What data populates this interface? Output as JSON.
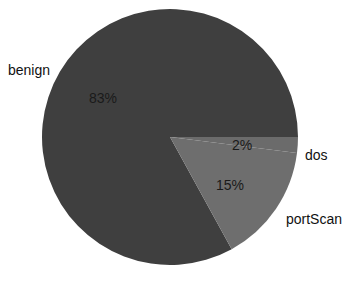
{
  "chart_data": {
    "type": "pie",
    "title": "",
    "categories": [
      "benign",
      "dos",
      "portScan"
    ],
    "values": [
      83,
      2,
      15
    ],
    "value_labels": [
      "83%",
      "2%",
      "15%"
    ],
    "units": "percent",
    "legend_position": "outside-labels",
    "grid": false,
    "colors": {
      "benign": "#3f3f3f",
      "dos": "#6b6b6b",
      "portScan": "#6e6e6e",
      "background": "#ffffff",
      "label_text": "#111111"
    },
    "geometry": {
      "center_x": 170,
      "center_y": 137,
      "radius": 128,
      "start_angle_deg": 0,
      "direction": "clockwise"
    },
    "slices": [
      {
        "name": "benign",
        "percent": 83,
        "label": "benign",
        "value_label": "83%",
        "color": "#3f3f3f",
        "start_angle_deg": 61.2,
        "end_angle_deg": 360.0
      },
      {
        "name": "dos",
        "percent": 2,
        "label": "dos",
        "value_label": "2%",
        "color": "#6b6b6b",
        "start_angle_deg": 0.0,
        "end_angle_deg": 7.2
      },
      {
        "name": "portScan",
        "percent": 15,
        "label": "portScan",
        "value_label": "15%",
        "color": "#6e6e6e",
        "start_angle_deg": 7.2,
        "end_angle_deg": 61.2
      }
    ]
  },
  "labels": {
    "benign_category": "benign",
    "benign_percent": "83%",
    "dos_category": "dos",
    "dos_percent": "2%",
    "portscan_category": "portScan",
    "portscan_percent": "15%"
  }
}
